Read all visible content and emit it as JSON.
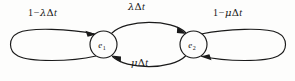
{
  "diagram": {
    "type": "state-transition-diagram",
    "width": 295,
    "height": 81,
    "background_color": "#fdfdfc",
    "stroke_color": "#1a1a1a",
    "text_color": "#161616",
    "states": [
      {
        "id": "e1",
        "label_base": "e",
        "label_sub": "1",
        "cx": 103.5,
        "cy": 44.5,
        "r": 13.5
      },
      {
        "id": "e2",
        "label_base": "e",
        "label_sub": "2",
        "cx": 193.5,
        "cy": 44.5,
        "r": 13.5
      }
    ],
    "transitions": [
      {
        "id": "self-left",
        "from": "e1",
        "to": "e1",
        "kind": "self-loop",
        "side": "left",
        "label_parts": {
          "number": "1",
          "operator": "−",
          "rate": "λ",
          "delta": "Δ",
          "time": "t"
        },
        "label_text": "1−λΔt"
      },
      {
        "id": "forward",
        "from": "e1",
        "to": "e2",
        "kind": "arc",
        "side": "top",
        "label_parts": {
          "number": "",
          "operator": "",
          "rate": "λ",
          "delta": "Δ",
          "time": "t"
        },
        "label_text": "λΔt"
      },
      {
        "id": "self-right",
        "from": "e2",
        "to": "e2",
        "kind": "self-loop",
        "side": "right",
        "label_parts": {
          "number": "1",
          "operator": "−",
          "rate": "μ",
          "delta": "Δ",
          "time": "t"
        },
        "label_text": "1−μΔt"
      },
      {
        "id": "backward",
        "from": "e2",
        "to": "e1",
        "kind": "arc",
        "side": "bottom",
        "label_parts": {
          "number": "",
          "operator": "",
          "rate": "μ",
          "delta": "Δ",
          "time": "t"
        },
        "label_text": "μΔt"
      }
    ]
  }
}
